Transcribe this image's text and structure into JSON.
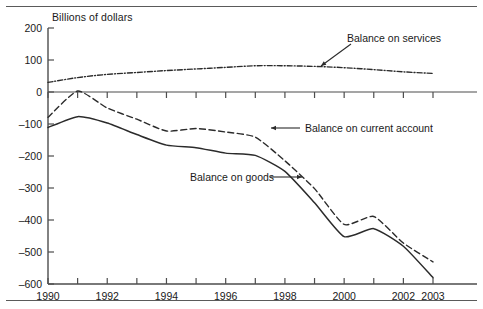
{
  "figure": {
    "axis_title": "Billions of dollars",
    "rules": {
      "top": "horizontal-rule",
      "bottom": "horizontal-rule"
    }
  },
  "chart_data": {
    "type": "line",
    "title": "",
    "subtitle": "",
    "xlabel": "",
    "ylabel": "Billions of dollars",
    "xlim": [
      1990,
      2003
    ],
    "ylim": [
      -600,
      200
    ],
    "grid": false,
    "legend_position": "inline-annotations",
    "x": [
      1990,
      1991,
      1992,
      1993,
      1994,
      1995,
      1996,
      1997,
      1998,
      1999,
      2000,
      2001,
      2002,
      2003
    ],
    "xticks": [
      1990,
      1991,
      1992,
      1993,
      1994,
      1995,
      1996,
      1997,
      1998,
      1999,
      2000,
      2001,
      2002,
      2003
    ],
    "xtick_labels": [
      "1990",
      "",
      "1992",
      "",
      "1994",
      "",
      "1996",
      "",
      "1998",
      "",
      "2000",
      "",
      "2002",
      "2003"
    ],
    "yticks": [
      200,
      100,
      0,
      -100,
      -200,
      -300,
      -400,
      -500,
      -600
    ],
    "ytick_labels": [
      "200",
      "100",
      "0",
      "-100",
      "-200",
      "-300",
      "-400",
      "-500",
      "-600"
    ],
    "series": [
      {
        "name": "Balance on services",
        "style": "dash-dot",
        "color": "#2b2b2b",
        "values": [
          30,
          45,
          55,
          61,
          67,
          72,
          77,
          82,
          82,
          80,
          76,
          70,
          63,
          58
        ]
      },
      {
        "name": "Balance on current account",
        "style": "dashed",
        "color": "#2b2b2b",
        "values": [
          -79,
          3,
          -50,
          -85,
          -122,
          -114,
          -125,
          -141,
          -215,
          -302,
          -414,
          -389,
          -472,
          -531
        ]
      },
      {
        "name": "Balance on goods",
        "style": "solid",
        "color": "#2b2b2b",
        "values": [
          -111,
          -77,
          -97,
          -133,
          -166,
          -174,
          -191,
          -198,
          -248,
          -346,
          -452,
          -427,
          -482,
          -580
        ]
      }
    ],
    "annotations": [
      {
        "text": "Balance on services",
        "target_series": "Balance on services",
        "target_x": 1998,
        "arrow": "down-left"
      },
      {
        "text": "Balance on current account",
        "target_series": "Balance on current account",
        "target_x": 1997,
        "arrow": "left"
      },
      {
        "text": "Balance on goods",
        "target_series": "Balance on goods",
        "target_x": 1998.6,
        "arrow": "right"
      }
    ]
  }
}
